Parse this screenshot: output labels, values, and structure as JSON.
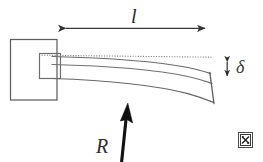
{
  "figure": {
    "type": "engineering-diagram",
    "canvas": {
      "width": 263,
      "height": 162,
      "background": "#ffffff"
    },
    "labels": {
      "length": "l",
      "deflection": "δ",
      "force": "R"
    },
    "colors": {
      "outline": "#5b5b5b",
      "beam": "#6a6a6a",
      "dotted_reference": "#7a7a7a",
      "dimension_arrow": "#3c3c3c",
      "force_arrow": "#111111",
      "text": "#1b1b1b"
    },
    "elements": [
      {
        "name": "wall-support",
        "description": "fixed support block at left end",
        "rect": {
          "x": 10,
          "y": 39,
          "width": 47,
          "height": 61
        }
      },
      {
        "name": "beam-root",
        "description": "rectangular root section of the beam inside the support",
        "rect": {
          "x": 39,
          "y": 53,
          "width": 21,
          "height": 25
        }
      },
      {
        "name": "reference-line",
        "description": "horizontal dotted undeformed axis line",
        "from": {
          "x": 39,
          "y": 55
        },
        "to": {
          "x": 213,
          "y": 57
        },
        "style": "dotted"
      },
      {
        "name": "beam-top-edge",
        "description": "upper surface of the deflected beam"
      },
      {
        "name": "beam-neutral-axis",
        "description": "inner line along the beam"
      },
      {
        "name": "beam-bottom-edge",
        "description": "lower surface of the deflected beam"
      },
      {
        "name": "beam-end-face",
        "description": "slanted free end face of the beam",
        "from": {
          "x": 210,
          "y": 63
        },
        "to": {
          "x": 214,
          "y": 106
        }
      },
      {
        "name": "length-dimension-arrow",
        "description": "horizontal double headed arrow measuring beam length l",
        "from": {
          "x": 57,
          "y": 28
        },
        "to": {
          "x": 213,
          "y": 28
        }
      },
      {
        "name": "deflection-dimension-arrow",
        "description": "vertical double headed arrow measuring tip deflection delta",
        "from": {
          "x": 227,
          "y": 56
        },
        "to": {
          "x": 227,
          "y": 81
        }
      },
      {
        "name": "force-arrow",
        "description": "thick solid arrow indicating applied reaction force R pointing up",
        "from": {
          "x": 122,
          "y": 162
        },
        "to": {
          "x": 127,
          "y": 104
        }
      },
      {
        "name": "broken-image-placeholder",
        "description": "small broken image placeholder glyph in lower right corner"
      }
    ]
  }
}
